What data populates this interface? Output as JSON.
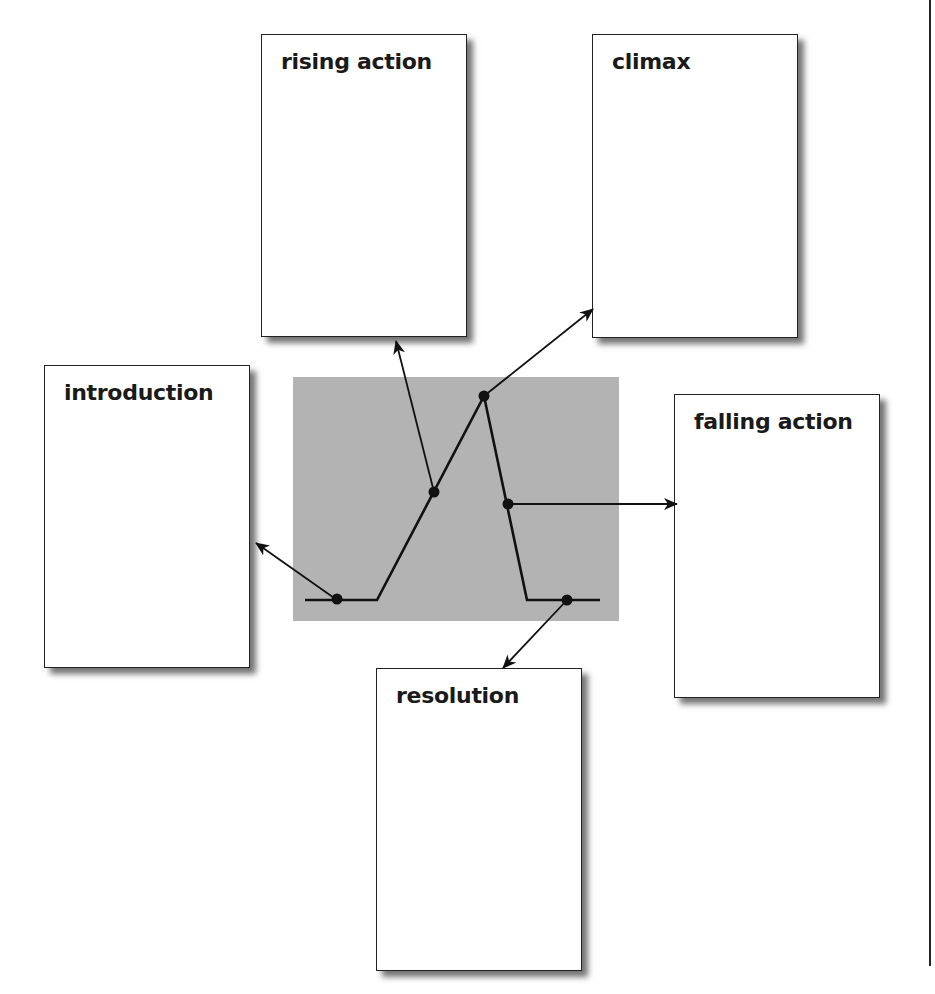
{
  "diagram": {
    "type": "plot-structure",
    "panel_color": "#b3b3b3",
    "line_color": "#111111",
    "cards": [
      {
        "id": "introduction",
        "label": "introduction",
        "x": 44,
        "y": 365
      },
      {
        "id": "rising_action",
        "label": "rising action",
        "x": 261,
        "y": 34
      },
      {
        "id": "climax",
        "label": "climax",
        "x": 592,
        "y": 34
      },
      {
        "id": "falling_action",
        "label": "falling action",
        "x": 674,
        "y": 394
      },
      {
        "id": "resolution",
        "label": "resolution",
        "x": 376,
        "y": 668
      }
    ],
    "plot_line_points": [
      [
        305,
        600
      ],
      [
        377,
        600
      ],
      [
        484,
        396
      ],
      [
        527,
        600
      ],
      [
        600,
        600
      ]
    ],
    "stage_points": [
      {
        "stage": "introduction",
        "x": 337,
        "y": 600,
        "arrow_to": [
          255,
          542
        ]
      },
      {
        "stage": "rising action",
        "x": 434,
        "y": 492,
        "arrow_to": [
          396,
          340
        ]
      },
      {
        "stage": "climax",
        "x": 484,
        "y": 396,
        "arrow_to": [
          593,
          309
        ]
      },
      {
        "stage": "falling action",
        "x": 508,
        "y": 504,
        "arrow_to": [
          676,
          504
        ]
      },
      {
        "stage": "resolution",
        "x": 567,
        "y": 600,
        "arrow_to": [
          503,
          668
        ]
      }
    ]
  }
}
